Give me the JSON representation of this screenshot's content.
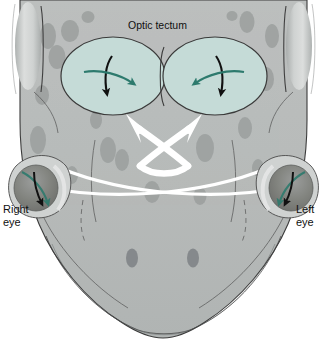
{
  "figure": {
    "kind": "anatomical-diagram",
    "background_color": "#ffffff"
  },
  "labels": {
    "optic_tectum": "Optic tectum",
    "right_eye": "Right\neye",
    "left_eye": "Left\neye"
  },
  "colors": {
    "head_fill": "#b9bcbb",
    "head_fill_lower": "#b3b7b6",
    "head_outline": "#3b3b3b",
    "tectum_fill": "#c5dbd7",
    "tectum_outline": "#3a3a3a",
    "spot": "#9a9e9d",
    "spot_dark": "#8b8f8e",
    "ear_highlight": "#d7dad9",
    "nerve_white": "#ffffff",
    "arrow_black": "#111111",
    "arrow_teal": "#2d7a6d",
    "eye_dark": "#7e7f7e",
    "label_text": "#101010"
  },
  "structures": [
    {
      "name": "optic-tectum-left-lobe",
      "side": "image-left",
      "black_arrow": "down",
      "teal_arrow": "right"
    },
    {
      "name": "optic-tectum-right-lobe",
      "side": "image-right",
      "black_arrow": "down",
      "teal_arrow": "left"
    },
    {
      "name": "optic-chiasm",
      "description": "white crossing nerve tracts forming an X"
    },
    {
      "name": "right-eye",
      "side": "image-left",
      "black_arrow": "down",
      "teal_arrow": "down-left"
    },
    {
      "name": "left-eye",
      "side": "image-right",
      "black_arrow": "down",
      "teal_arrow": "down-left"
    },
    {
      "name": "nostrils",
      "count": 2
    },
    {
      "name": "tympanum",
      "count": 2
    }
  ]
}
